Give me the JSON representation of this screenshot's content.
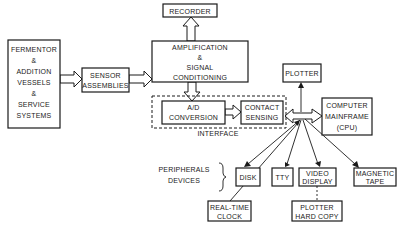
{
  "diagram": {
    "nodes": {
      "fermentor": {
        "lines": [
          "FERMENTOR",
          "&",
          "ADDITION",
          "VESSELS",
          "&",
          "SERVICE",
          "SYSTEMS"
        ]
      },
      "sensor": {
        "lines": [
          "SENSOR",
          "ASSEMBLIES"
        ]
      },
      "amplification": {
        "lines": [
          "AMPLIFICATION",
          "&",
          "SIGNAL",
          "CONDITIONING"
        ]
      },
      "recorder": {
        "lines": [
          "RECORDER"
        ]
      },
      "ad_conversion": {
        "lines": [
          "A/D",
          "CONVERSION"
        ]
      },
      "contact_sensing": {
        "lines": [
          "CONTACT",
          "SENSING"
        ]
      },
      "interface": {
        "label": "INTERFACE"
      },
      "plotter": {
        "lines": [
          "PLOTTER"
        ]
      },
      "computer": {
        "lines": [
          "COMPUTER",
          "MAINFRAME",
          "(CPU)"
        ]
      },
      "disk": {
        "lines": [
          "DISK"
        ]
      },
      "tty": {
        "lines": [
          "TTY"
        ]
      },
      "video_display": {
        "lines": [
          "VIDEO",
          "DISPLAY"
        ]
      },
      "magnetic_tape": {
        "lines": [
          "MAGNETIC",
          "TAPE"
        ]
      },
      "real_time_clock": {
        "lines": [
          "REAL-TIME",
          "CLOCK"
        ]
      },
      "plotter_hard_copy": {
        "lines": [
          "PLOTTER",
          "HARD COPY"
        ]
      }
    },
    "annotations": {
      "peripherals": [
        "PERIPHERALS",
        "DEVICES"
      ]
    },
    "edges": [
      {
        "from": "fermentor",
        "to": "sensor",
        "style": "hollow-arrow"
      },
      {
        "from": "sensor",
        "to": "amplification",
        "style": "hollow-arrow"
      },
      {
        "from": "amplification",
        "to": "recorder",
        "style": "hollow-arrow"
      },
      {
        "from": "amplification",
        "to": "ad_conversion",
        "style": "hollow-arrow"
      },
      {
        "from": "ad_conversion",
        "to": "contact_sensing",
        "style": "hollow-arrow"
      },
      {
        "from": "bus",
        "to": "contact_sensing",
        "style": "hollow-double-arrow"
      },
      {
        "from": "bus",
        "to": "computer",
        "style": "hollow-double-arrow"
      },
      {
        "from": "bus",
        "to": "plotter",
        "style": "arrow"
      },
      {
        "from": "bus",
        "to": "disk",
        "style": "arrow"
      },
      {
        "from": "bus",
        "to": "tty",
        "style": "arrow"
      },
      {
        "from": "bus",
        "to": "video_display",
        "style": "arrow"
      },
      {
        "from": "bus",
        "to": "magnetic_tape",
        "style": "arrow"
      },
      {
        "from": "real_time_clock",
        "to": "bus",
        "style": "arrow"
      },
      {
        "from": "video_display",
        "to": "plotter_hard_copy",
        "style": "dashed"
      }
    ]
  }
}
